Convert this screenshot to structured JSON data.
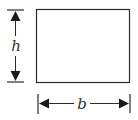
{
  "diagram": {
    "type": "rectangle-dimension-diagram",
    "shape": "rectangle",
    "stroke_color": "#2b2b2b",
    "fill_color": "#ffffff",
    "dimensions": {
      "height": {
        "label": "h",
        "orientation": "vertical",
        "position": "left"
      },
      "width": {
        "label": "b",
        "orientation": "horizontal",
        "position": "bottom"
      }
    }
  }
}
